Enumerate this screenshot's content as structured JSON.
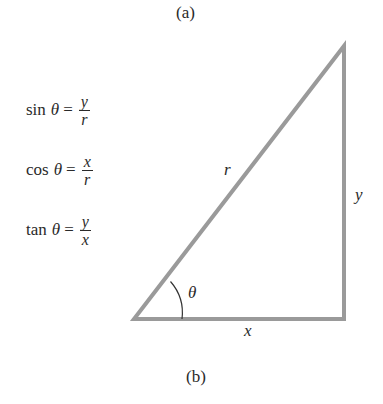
{
  "panels": {
    "a_label": "(a)",
    "b_label": "(b)"
  },
  "formulas": [
    {
      "fn": "sin",
      "var": "θ",
      "eq": "=",
      "numerator": "y",
      "denominator": "r"
    },
    {
      "fn": "cos",
      "var": "θ",
      "eq": "=",
      "numerator": "x",
      "denominator": "r"
    },
    {
      "fn": "tan",
      "var": "θ",
      "eq": "=",
      "numerator": "y",
      "denominator": "x"
    }
  ],
  "triangle": {
    "vertices": {
      "bottom_left": [
        134,
        319
      ],
      "bottom_right": [
        344,
        319
      ],
      "top_right": [
        344,
        46
      ]
    },
    "stroke_color": "#9a9a9a",
    "stroke_width": 4,
    "labels": {
      "hypotenuse": "r",
      "opposite": "y",
      "adjacent": "x",
      "angle": "θ"
    }
  }
}
